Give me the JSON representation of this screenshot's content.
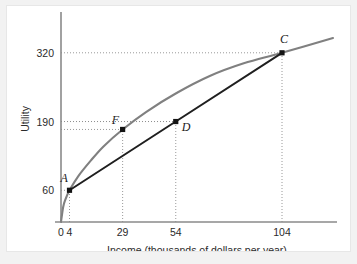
{
  "figure": {
    "background_color": "#f2f2f2",
    "panel_color": "#ffffff"
  },
  "chart_data": {
    "type": "line",
    "title": "",
    "subtitle": "",
    "xlabel": "Income (thousands of dollars per year)",
    "ylabel": "Utility",
    "xlim": [
      0,
      128
    ],
    "ylim": [
      0,
      382
    ],
    "grid": false,
    "legend_position": "none",
    "xticks": [
      {
        "value": 0,
        "label": "0"
      },
      {
        "value": 4,
        "label": "4"
      },
      {
        "value": 29,
        "label": "29"
      },
      {
        "value": 54,
        "label": "54"
      },
      {
        "value": 104,
        "label": "104"
      }
    ],
    "yticks": [
      {
        "value": 60,
        "label": "60"
      },
      {
        "value": 190,
        "label": "190"
      },
      {
        "value": 320,
        "label": "320"
      }
    ],
    "series": [
      {
        "name": "utility-curve",
        "type": "line",
        "color": "#808080",
        "shape": "concave",
        "points": [
          {
            "x": 0,
            "y": 0
          },
          {
            "x": 1,
            "y": 28
          },
          {
            "x": 2,
            "y": 42
          },
          {
            "x": 4,
            "y": 60
          },
          {
            "x": 8,
            "y": 86
          },
          {
            "x": 14,
            "y": 116
          },
          {
            "x": 20,
            "y": 143
          },
          {
            "x": 29,
            "y": 175
          },
          {
            "x": 40,
            "y": 208
          },
          {
            "x": 54,
            "y": 243
          },
          {
            "x": 70,
            "y": 276
          },
          {
            "x": 86,
            "y": 300
          },
          {
            "x": 104,
            "y": 320
          },
          {
            "x": 128,
            "y": 348
          }
        ]
      },
      {
        "name": "chord-line",
        "type": "line",
        "color": "#1f1f1f",
        "points": [
          {
            "x": 4,
            "y": 60
          },
          {
            "x": 54,
            "y": 190
          },
          {
            "x": 104,
            "y": 320
          }
        ]
      }
    ],
    "annotations": [
      {
        "label": "A",
        "x": 4,
        "y": 60,
        "on": "both",
        "label_dx": -9,
        "label_dy": -8
      },
      {
        "label": "F",
        "x": 29,
        "y": 175,
        "on": "utility-curve",
        "label_dx": -11,
        "label_dy": -5
      },
      {
        "label": "D",
        "x": 54,
        "y": 190,
        "on": "chord-line",
        "label_dx": 6,
        "label_dy": 9
      },
      {
        "label": "C",
        "x": 104,
        "y": 320,
        "on": "both",
        "label_dx": -2,
        "label_dy": -10
      }
    ],
    "guide_lines": {
      "vertical_at_x": [
        4,
        29,
        54,
        104
      ],
      "horizontal_at_y": [
        60,
        175,
        190,
        320
      ]
    }
  }
}
